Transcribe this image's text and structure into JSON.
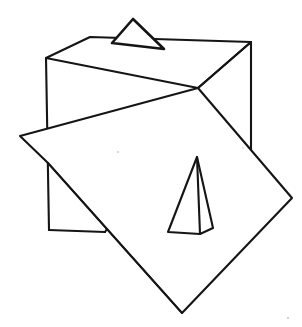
{
  "figure": {
    "background_color": "#ffffff",
    "stroke_color": "#151515",
    "canvas": {
      "width": 302,
      "height": 327
    },
    "shapes": {
      "cube": {
        "name": "cube",
        "label": "Cube",
        "vertices": {
          "top_back_left": [
            90,
            37
          ],
          "top_back_right": [
            251,
            42
          ],
          "top_front_left": [
            46,
            58
          ],
          "top_front_right": [
            198,
            88
          ],
          "bottom_front_left": [
            49,
            230
          ],
          "bottom_front_right": [
            105,
            232
          ],
          "bottom_back_right": [
            251,
            152
          ]
        },
        "top_face_path": "M 46 58 L 90 37 L 251 42 L 198 88 Z",
        "left_face_path": "M 46 58 L 198 88 L 105 232 L 49 230 Z",
        "right_edge_path": "M 251 42 L 251 152",
        "right_face_path": "M 198 88 L 251 42 L 251 152",
        "vertical_left_edge_path": "M 46 58 L 49 230",
        "bottom_edge_path": "M 49 230 L 105 232"
      },
      "notch_triangle": {
        "name": "notch-triangle",
        "label": "Small triangle on top face",
        "vertices": [
          [
            133,
            19
          ],
          [
            112,
            43
          ],
          [
            164,
            49
          ]
        ],
        "path": "M 133 19 L 112 43 L 164 49 Z"
      },
      "diamond_panel": {
        "name": "diamond-panel",
        "label": "Rotated square panel",
        "vertices": {
          "top": [
            198,
            88
          ],
          "right": [
            292,
            198
          ],
          "bottom": [
            182,
            313
          ],
          "left": [
            20,
            136
          ],
          "inner_junction": [
            48,
            163
          ]
        },
        "path": "M 198 88 L 292 198 L 182 313 L 48 163 L 20 136 Z",
        "fold_edge_path": "M 20 136 L 48 163",
        "crease_path": "M 48 163 L 182 313"
      },
      "pyramid": {
        "name": "pyramid",
        "label": "Tall pyramid on panel",
        "vertices": {
          "apex": [
            197,
            157
          ],
          "base_left": [
            168,
            232
          ],
          "base_right": [
            213,
            228
          ],
          "base_front": [
            200,
            234
          ]
        },
        "outline_path": "M 197 157 L 168 232 L 200 234 L 213 228 Z",
        "center_edge_path": "M 197 157 L 200 234"
      }
    }
  }
}
